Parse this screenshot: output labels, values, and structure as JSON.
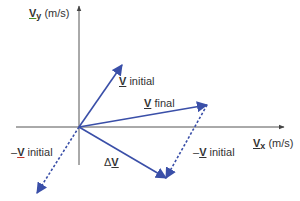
{
  "diagram": {
    "type": "vector-subtraction",
    "axes": {
      "y_label_symbol": "V",
      "y_label_sub": "y",
      "y_label_unit": "(m/s)",
      "x_label_symbol": "V",
      "x_label_sub": "x",
      "x_label_unit": "(m/s)"
    },
    "vectors": [
      {
        "name": "V initial",
        "symbol": "V",
        "text": "initial",
        "from": [
          79,
          127
        ],
        "to": [
          122,
          65
        ],
        "style": "solid"
      },
      {
        "name": "V final",
        "symbol": "V",
        "text": "final",
        "from": [
          79,
          127
        ],
        "to": [
          207,
          105
        ],
        "style": "solid"
      },
      {
        "name": "-V initial (origin)",
        "prefix": "–",
        "symbol": "V",
        "text": "initial",
        "from": [
          79,
          127
        ],
        "to": [
          37,
          193
        ],
        "style": "dashed"
      },
      {
        "name": "-V initial (tip)",
        "prefix": "–",
        "symbol": "V",
        "text": "initial",
        "from": [
          207,
          105
        ],
        "to": [
          166,
          178
        ],
        "style": "dashed"
      },
      {
        "name": "delta V",
        "prefix": "Δ",
        "symbol": "V",
        "text": "",
        "from": [
          79,
          127
        ],
        "to": [
          166,
          178
        ],
        "style": "solid"
      }
    ],
    "colors": {
      "vector": "#3a4fa8",
      "axis": "#555555",
      "text": "#333333"
    }
  }
}
